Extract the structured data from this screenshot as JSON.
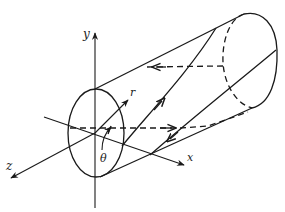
{
  "figure": {
    "labels": {
      "y_axis": "y",
      "z_axis": "z",
      "x_axis": "x",
      "radius": "r",
      "angle": "θ"
    },
    "colors": {
      "stroke": "#1a1a1a",
      "background": "#ffffff"
    }
  }
}
